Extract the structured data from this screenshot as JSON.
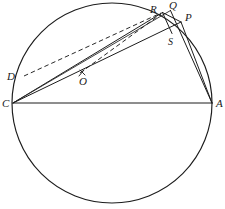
{
  "figure": {
    "type": "geometry-diagram",
    "background_color": "#ffffff",
    "ink_color": "#1c1c1c",
    "circle": {
      "cx": 112,
      "cy": 103,
      "r": 100
    },
    "labels": {
      "A": "A",
      "C": "C",
      "D": "D",
      "O": "O",
      "P": "P",
      "Q": "Q",
      "R": "R",
      "S": "S"
    },
    "points": {
      "A": {
        "x": 212,
        "y": 103
      },
      "C": {
        "x": 13,
        "y": 103
      },
      "D": {
        "x": 24,
        "y": 76
      },
      "O": {
        "x": 112,
        "y": 103
      },
      "P": {
        "x": 181,
        "y": 22
      },
      "Q": {
        "x": 171,
        "y": 10
      },
      "R": {
        "x": 162,
        "y": 12
      },
      "S": {
        "x": 172,
        "y": 33
      }
    },
    "label_positions": {
      "A": {
        "x": 216,
        "y": 107
      },
      "C": {
        "x": 2,
        "y": 107
      },
      "D": {
        "x": 9,
        "y": 80
      },
      "O": {
        "x": 79,
        "y": 84
      },
      "P": {
        "x": 186,
        "y": 20
      },
      "Q": {
        "x": 170,
        "y": 8
      },
      "R": {
        "x": 151,
        "y": 11
      },
      "S": {
        "x": 169,
        "y": 44
      }
    },
    "segments": [
      {
        "name": "chord-CA",
        "from": "C",
        "to": "A",
        "style": "solid"
      },
      {
        "name": "chord-CR",
        "from": "C",
        "to": "R",
        "style": "solid"
      },
      {
        "name": "chord-CQ",
        "from": "C",
        "to": "Q",
        "style": "solid"
      },
      {
        "name": "chord-CP",
        "from": "C",
        "to": "P",
        "style": "solid"
      },
      {
        "name": "chord-QA",
        "from": "Q",
        "to": "A",
        "style": "solid"
      },
      {
        "name": "chord-PA",
        "from": "P",
        "to": "A",
        "style": "solid"
      },
      {
        "name": "segment-RS",
        "from": "R",
        "to": "S",
        "style": "solid"
      },
      {
        "name": "segment-RP",
        "from": "R",
        "to": "P",
        "style": "solid"
      },
      {
        "name": "segment-DR",
        "from": "D",
        "to": "R",
        "style": "dashed"
      },
      {
        "name": "segment-OR",
        "from": "O",
        "to": "R",
        "style": "dashed"
      }
    ],
    "tick_marks": [
      {
        "name": "tick-on-CP-at-O",
        "x": 82,
        "y": 73
      }
    ]
  }
}
